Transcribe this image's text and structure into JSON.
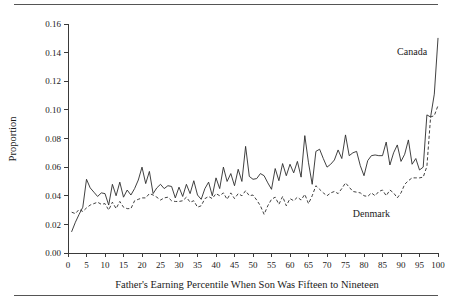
{
  "figure": {
    "top_rule": "",
    "bottom_rule": ""
  },
  "chart_data": {
    "type": "line",
    "title": "",
    "xlabel": "Father's Earning Percentile When Son Was Fifteen to Nineteen",
    "ylabel": "Proportion",
    "xlim": [
      0,
      100
    ],
    "ylim": [
      0.0,
      0.16
    ],
    "grid": false,
    "legend_position": "inline-annotation",
    "xticks": [
      0,
      5,
      10,
      15,
      20,
      25,
      30,
      35,
      40,
      45,
      50,
      55,
      60,
      65,
      70,
      75,
      80,
      85,
      90,
      95,
      100
    ],
    "xtick_labels": [
      "0",
      "5",
      "10",
      "15",
      "20",
      "25",
      "30",
      "35",
      "40",
      "45",
      "50",
      "55",
      "60",
      "65",
      "70",
      "75",
      "80",
      "85",
      "90",
      "95",
      "100"
    ],
    "yticks": [
      0.0,
      0.02,
      0.04,
      0.06,
      0.08,
      0.1,
      0.12,
      0.14,
      0.16
    ],
    "ytick_labels": [
      "0.00",
      "0.02",
      "0.04",
      "0.06",
      "0.08",
      "0.10",
      "0.12",
      "0.14",
      "0.16"
    ],
    "x": [
      1,
      2,
      3,
      4,
      5,
      6,
      7,
      8,
      9,
      10,
      11,
      12,
      13,
      14,
      15,
      16,
      17,
      18,
      19,
      20,
      21,
      22,
      23,
      24,
      25,
      26,
      27,
      28,
      29,
      30,
      31,
      32,
      33,
      34,
      35,
      36,
      37,
      38,
      39,
      40,
      41,
      42,
      43,
      44,
      45,
      46,
      47,
      48,
      49,
      50,
      51,
      52,
      53,
      54,
      55,
      56,
      57,
      58,
      59,
      60,
      61,
      62,
      63,
      64,
      65,
      66,
      67,
      68,
      69,
      70,
      71,
      72,
      73,
      74,
      75,
      76,
      77,
      78,
      79,
      80,
      81,
      82,
      83,
      84,
      85,
      86,
      87,
      88,
      89,
      90,
      91,
      92,
      93,
      94,
      95,
      96,
      97,
      98,
      99,
      100
    ],
    "series": [
      {
        "name": "Canada",
        "style": "solid",
        "color": "#2b2b2b",
        "label_x": 93,
        "label_y": 0.138,
        "values": [
          0.015,
          0.0215,
          0.027,
          0.032,
          0.0515,
          0.0455,
          0.0425,
          0.0395,
          0.042,
          0.0415,
          0.0335,
          0.048,
          0.04,
          0.0495,
          0.039,
          0.044,
          0.0405,
          0.045,
          0.051,
          0.06,
          0.0485,
          0.057,
          0.0415,
          0.0455,
          0.048,
          0.045,
          0.047,
          0.0465,
          0.0385,
          0.046,
          0.0395,
          0.048,
          0.0415,
          0.0505,
          0.0405,
          0.0375,
          0.045,
          0.0495,
          0.04,
          0.0525,
          0.045,
          0.06,
          0.05,
          0.0555,
          0.047,
          0.0585,
          0.05,
          0.0745,
          0.0535,
          0.0515,
          0.052,
          0.0555,
          0.054,
          0.049,
          0.0445,
          0.059,
          0.0505,
          0.0625,
          0.054,
          0.062,
          0.056,
          0.064,
          0.053,
          0.082,
          0.063,
          0.048,
          0.071,
          0.0725,
          0.066,
          0.06,
          0.062,
          0.065,
          0.072,
          0.066,
          0.0825,
          0.068,
          0.07,
          0.071,
          0.061,
          0.054,
          0.0645,
          0.068,
          0.0685,
          0.068,
          0.068,
          0.0775,
          0.0615,
          0.07,
          0.0755,
          0.064,
          0.069,
          0.079,
          0.062,
          0.066,
          0.058,
          0.06,
          0.0965,
          0.095,
          0.111,
          0.15
        ]
      },
      {
        "name": "Denmark",
        "style": "dashed",
        "color": "#2b2b2b",
        "label_x": 82,
        "label_y": 0.0255,
        "values": [
          0.0285,
          0.0275,
          0.0305,
          0.029,
          0.0315,
          0.0335,
          0.0345,
          0.0355,
          0.034,
          0.0345,
          0.03,
          0.0355,
          0.031,
          0.036,
          0.032,
          0.031,
          0.031,
          0.0365,
          0.0375,
          0.0385,
          0.0385,
          0.0415,
          0.0405,
          0.039,
          0.037,
          0.0385,
          0.039,
          0.0365,
          0.036,
          0.036,
          0.0365,
          0.039,
          0.0355,
          0.0365,
          0.032,
          0.033,
          0.038,
          0.0395,
          0.038,
          0.0415,
          0.04,
          0.042,
          0.0375,
          0.042,
          0.038,
          0.0415,
          0.04,
          0.0435,
          0.04,
          0.0405,
          0.037,
          0.033,
          0.027,
          0.033,
          0.0375,
          0.039,
          0.034,
          0.0395,
          0.033,
          0.038,
          0.0365,
          0.039,
          0.037,
          0.041,
          0.0345,
          0.04,
          0.047,
          0.0445,
          0.042,
          0.04,
          0.042,
          0.043,
          0.0415,
          0.045,
          0.049,
          0.046,
          0.043,
          0.0425,
          0.042,
          0.04,
          0.0395,
          0.042,
          0.04,
          0.043,
          0.044,
          0.04,
          0.044,
          0.042,
          0.0385,
          0.042,
          0.048,
          0.0505,
          0.0525,
          0.0525,
          0.0525,
          0.053,
          0.0605,
          0.095,
          0.096,
          0.103
        ]
      }
    ]
  }
}
